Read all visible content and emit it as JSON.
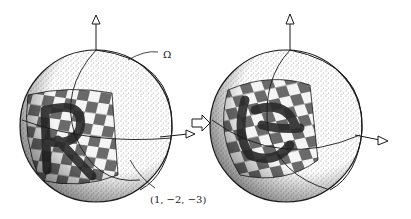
{
  "figure": {
    "left_sphere": {
      "omega_label": "Ω",
      "axis_label": "(1, −2, −3)",
      "letter": "R"
    },
    "transition_arrow": "⇨",
    "right_sphere": {
      "letter": "R"
    },
    "colors": {
      "ink": "#1a1a1a",
      "stipple": "#555555",
      "paper": "#ffffff",
      "checker_dark": "#6a6a6a",
      "checker_light": "#f4f4f4"
    }
  }
}
